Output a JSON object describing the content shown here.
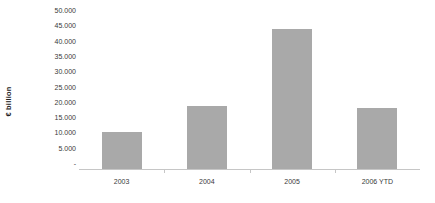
{
  "chart_data": {
    "type": "bar",
    "title": "",
    "subtitle": "",
    "xlabel": "",
    "ylabel": "€ billion",
    "categories": [
      "2003",
      "2004",
      "2005",
      "2006 YTD"
    ],
    "values": [
      12000,
      20500,
      45600,
      20000
    ],
    "series": [
      {
        "name": "",
        "values": [
          12000,
          20500,
          45600,
          20000
        ]
      }
    ],
    "ylim": [
      0,
      50000
    ],
    "y_tick_values": [
      0,
      5000,
      10000,
      15000,
      20000,
      25000,
      30000,
      35000,
      40000,
      45000,
      50000
    ],
    "y_tick_labels": [
      "-",
      "5.000",
      "10.000",
      "15.000",
      "20.000",
      "25.000",
      "30.000",
      "35.000",
      "40.000",
      "45.000",
      "50.000"
    ],
    "grid": false,
    "legend": false,
    "legend_position": "none",
    "number_format": "european-period-thousands",
    "bar_color": "#a9a9a9",
    "axis_color": "#c6c6c6",
    "text_color": "#3a3a3a",
    "background_color": "#ffffff"
  }
}
